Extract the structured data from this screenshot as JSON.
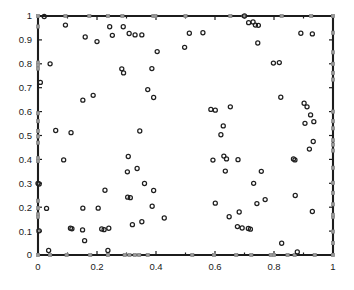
{
  "chart_data": {
    "type": "scatter",
    "title": "",
    "xlabel": "",
    "ylabel": "",
    "xlim": [
      0,
      1
    ],
    "ylim": [
      0,
      1
    ],
    "grid": false,
    "legend": null,
    "xticks": [
      0,
      0.2,
      0.4,
      0.6,
      0.8,
      1
    ],
    "xtick_labels": [
      "0",
      "0.2",
      "0.4",
      "0.6",
      "0.8",
      "1"
    ],
    "yticks": [
      0,
      0.1,
      0.2,
      0.3,
      0.4,
      0.5,
      0.6,
      0.7,
      0.8,
      0.9,
      1
    ],
    "ytick_labels": [
      "0",
      "0.1",
      "0.2",
      "0.3",
      "0.4",
      "0.5",
      "0.6",
      "0.7",
      "0.8",
      "0.9",
      "1"
    ],
    "xminor_ticks": [
      0.1,
      0.3,
      0.5,
      0.7,
      0.9
    ],
    "colors": {
      "interior_marker": "#1f1f1f",
      "boundary_marker": "#9a9a9a",
      "axis": "#1c1c1c",
      "background": "#ffffff"
    },
    "series": [
      {
        "name": "interior-points",
        "marker": "circle-open",
        "marker_size": 4.1,
        "color": "#1f1f1f",
        "points": [
          [
            0.021,
            0.998
          ],
          [
            0.093,
            0.962
          ],
          [
            0.16,
            0.912
          ],
          [
            0.2,
            0.893
          ],
          [
            0.243,
            0.955
          ],
          [
            0.252,
            0.919
          ],
          [
            0.289,
            0.955
          ],
          [
            0.309,
            0.927
          ],
          [
            0.329,
            0.921
          ],
          [
            0.352,
            0.921
          ],
          [
            0.041,
            0.8
          ],
          [
            0.008,
            0.722
          ],
          [
            0.152,
            0.648
          ],
          [
            0.187,
            0.668
          ],
          [
            0.404,
            0.851
          ],
          [
            0.386,
            0.78
          ],
          [
            0.284,
            0.779
          ],
          [
            0.29,
            0.762
          ],
          [
            0.372,
            0.692
          ],
          [
            0.392,
            0.659
          ],
          [
            0.06,
            0.521
          ],
          [
            0.112,
            0.512
          ],
          [
            0.345,
            0.519
          ],
          [
            0.0,
            0.3
          ],
          [
            0.004,
            0.297
          ],
          [
            0.087,
            0.398
          ],
          [
            0.004,
            0.101
          ],
          [
            0.029,
            0.195
          ],
          [
            0.036,
            0.019
          ],
          [
            0.11,
            0.112
          ],
          [
            0.115,
            0.11
          ],
          [
            0.151,
            0.105
          ],
          [
            0.158,
            0.06
          ],
          [
            0.152,
            0.196
          ],
          [
            0.204,
            0.196
          ],
          [
            0.216,
            0.109
          ],
          [
            0.224,
            0.106
          ],
          [
            0.24,
            0.112
          ],
          [
            0.237,
            0.019
          ],
          [
            0.227,
            0.271
          ],
          [
            0.306,
            0.412
          ],
          [
            0.303,
            0.348
          ],
          [
            0.336,
            0.362
          ],
          [
            0.304,
            0.242
          ],
          [
            0.313,
            0.24
          ],
          [
            0.361,
            0.299
          ],
          [
            0.32,
            0.127
          ],
          [
            0.352,
            0.139
          ],
          [
            0.387,
            0.204
          ],
          [
            0.392,
            0.27
          ],
          [
            0.428,
            0.155
          ],
          [
            0.513,
            0.928
          ],
          [
            0.497,
            0.869
          ],
          [
            0.559,
            0.93
          ],
          [
            0.586,
            0.609
          ],
          [
            0.601,
            0.606
          ],
          [
            0.652,
            0.62
          ],
          [
            0.628,
            0.54
          ],
          [
            0.62,
            0.503
          ],
          [
            0.593,
            0.397
          ],
          [
            0.63,
            0.414
          ],
          [
            0.639,
            0.402
          ],
          [
            0.635,
            0.351
          ],
          [
            0.678,
            0.399
          ],
          [
            0.601,
            0.217
          ],
          [
            0.648,
            0.16
          ],
          [
            0.676,
            0.119
          ],
          [
            0.682,
            0.18
          ],
          [
            0.692,
            0.113
          ],
          [
            0.713,
            0.111
          ],
          [
            0.72,
            0.108
          ],
          [
            0.731,
            0.3
          ],
          [
            0.757,
            0.35
          ],
          [
            0.742,
            0.215
          ],
          [
            0.77,
            0.232
          ],
          [
            0.7,
            1.0
          ],
          [
            0.714,
            0.972
          ],
          [
            0.729,
            0.975
          ],
          [
            0.737,
            0.962
          ],
          [
            0.747,
            0.961
          ],
          [
            0.745,
            0.887
          ],
          [
            0.798,
            0.803
          ],
          [
            0.818,
            0.805
          ],
          [
            0.823,
            0.66
          ],
          [
            0.891,
            0.928
          ],
          [
            0.93,
            0.925
          ],
          [
            0.902,
            0.635
          ],
          [
            0.912,
            0.62
          ],
          [
            0.924,
            0.586
          ],
          [
            0.935,
            0.558
          ],
          [
            0.905,
            0.551
          ],
          [
            0.866,
            0.402
          ],
          [
            0.871,
            0.398
          ],
          [
            0.933,
            0.475
          ],
          [
            0.92,
            0.443
          ],
          [
            0.872,
            0.249
          ],
          [
            0.93,
            0.182
          ],
          [
            0.826,
            0.049
          ],
          [
            0.879,
            0.013
          ]
        ]
      },
      {
        "name": "boundary-nodes",
        "marker": "square-filled",
        "marker_size": 3.1,
        "color": "#9a9a9a",
        "points": [
          [
            0.0,
            1.0
          ],
          [
            0.093,
            1.0
          ],
          [
            0.174,
            1.0
          ],
          [
            0.237,
            1.0
          ],
          [
            0.286,
            1.0
          ],
          [
            0.391,
            1.0
          ],
          [
            0.398,
            1.0
          ],
          [
            0.5,
            1.0
          ],
          [
            0.652,
            1.0
          ],
          [
            0.697,
            1.0
          ],
          [
            0.826,
            1.0
          ],
          [
            0.926,
            1.0
          ],
          [
            1.0,
            1.0
          ],
          [
            0.0,
            0.956
          ],
          [
            0.0,
            0.805
          ],
          [
            0.0,
            0.795
          ],
          [
            0.0,
            0.78
          ],
          [
            0.0,
            0.593
          ],
          [
            0.0,
            0.56
          ],
          [
            0.0,
            0.519
          ],
          [
            0.0,
            0.496
          ],
          [
            0.0,
            0.47
          ],
          [
            0.0,
            0.405
          ],
          [
            0.0,
            0.393
          ],
          [
            0.0,
            0.297
          ],
          [
            0.0,
            0.227
          ],
          [
            0.0,
            0.196
          ],
          [
            0.0,
            0.17
          ],
          [
            0.0,
            0.16
          ],
          [
            0.0,
            0.101
          ],
          [
            0.0,
            0.0
          ],
          [
            0.041,
            0.0
          ],
          [
            0.097,
            0.0
          ],
          [
            0.177,
            0.0
          ],
          [
            0.237,
            0.0
          ],
          [
            0.294,
            0.0
          ],
          [
            0.31,
            0.0
          ],
          [
            0.328,
            0.0
          ],
          [
            0.343,
            0.0
          ],
          [
            0.372,
            0.0
          ],
          [
            0.523,
            0.0
          ],
          [
            0.597,
            0.0
          ],
          [
            0.672,
            0.0
          ],
          [
            0.723,
            0.0
          ],
          [
            0.789,
            0.0
          ],
          [
            0.8,
            0.0
          ],
          [
            0.846,
            0.0
          ],
          [
            0.87,
            0.0
          ],
          [
            0.938,
            0.0
          ],
          [
            1.0,
            0.0
          ],
          [
            1.0,
            0.05
          ],
          [
            1.0,
            0.098
          ],
          [
            1.0,
            0.16
          ],
          [
            1.0,
            0.168
          ],
          [
            1.0,
            0.212
          ],
          [
            1.0,
            0.26
          ],
          [
            1.0,
            0.302
          ],
          [
            1.0,
            0.365
          ],
          [
            1.0,
            0.437
          ],
          [
            1.0,
            0.462
          ],
          [
            1.0,
            0.48
          ],
          [
            1.0,
            0.53
          ],
          [
            1.0,
            0.56
          ],
          [
            1.0,
            0.6
          ],
          [
            1.0,
            0.734
          ],
          [
            1.0,
            0.762
          ],
          [
            1.0,
            0.8
          ],
          [
            1.0,
            0.848
          ],
          [
            1.0,
            0.93
          ]
        ]
      }
    ]
  },
  "layout": {
    "plot_left_px": 38,
    "plot_right_px": 333,
    "plot_top_px": 16,
    "plot_bottom_px": 255
  }
}
